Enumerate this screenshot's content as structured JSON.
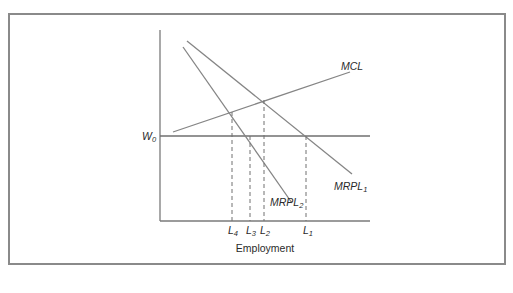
{
  "diagram": {
    "type": "labor-market-monopsony",
    "x_axis_label": "Employment",
    "y_axis_label": "",
    "wage_line": {
      "label": "W",
      "subscript": "0"
    },
    "curves": [
      {
        "id": "mcl",
        "label": "MCL",
        "subscript": ""
      },
      {
        "id": "mrpl1",
        "label": "MRPL",
        "subscript": "1"
      },
      {
        "id": "mrpl2",
        "label": "MRPL",
        "subscript": "2"
      }
    ],
    "x_ticks": [
      {
        "id": "l4",
        "label": "L",
        "subscript": "4"
      },
      {
        "id": "l3",
        "label": "L",
        "subscript": "3"
      },
      {
        "id": "l2",
        "label": "L",
        "subscript": "2"
      },
      {
        "id": "l1",
        "label": "L",
        "subscript": "1"
      }
    ],
    "colors": {
      "line": "#808080",
      "axis": "#7a7a7a",
      "frame": "#8a8a8a",
      "text": "#2a2a2a"
    }
  }
}
